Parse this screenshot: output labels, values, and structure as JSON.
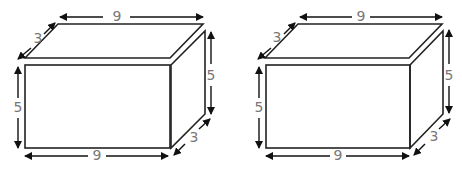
{
  "figures": [
    {
      "name": "rectangular-prism-left",
      "labels": {
        "top_length": "9",
        "top_depth": "3",
        "left_height": "5",
        "right_height": "5",
        "bottom_length": "9",
        "bottom_depth": "3"
      }
    },
    {
      "name": "rectangular-prism-right",
      "labels": {
        "top_length": "9",
        "top_depth": "3",
        "left_height": "5",
        "right_height": "5",
        "bottom_length": "9",
        "bottom_depth": "3"
      }
    }
  ],
  "colors": {
    "edge": "#222222",
    "arrow": "#111111",
    "label": "#777777"
  }
}
